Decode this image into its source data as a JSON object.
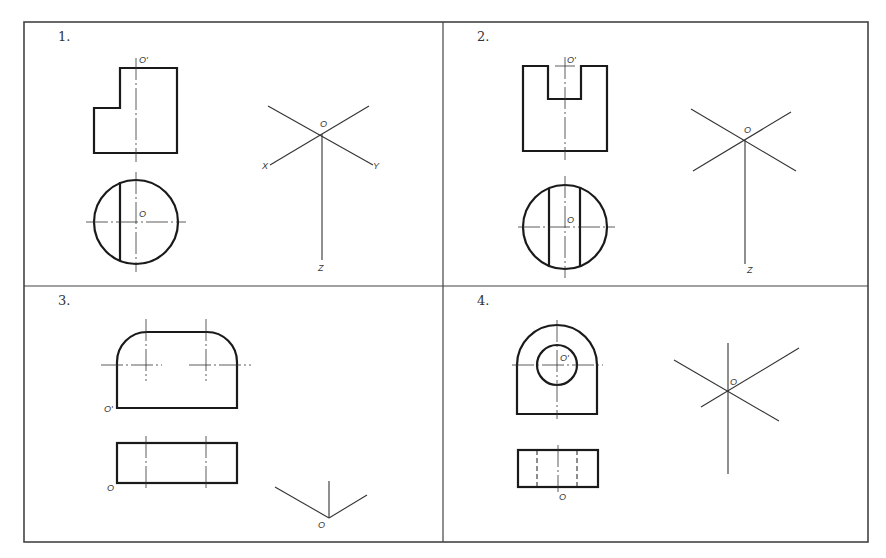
{
  "figure": {
    "type": "engineering-drawing-exercise"
  },
  "panels": [
    {
      "number": "1.",
      "front_view_label": "O'",
      "top_view_label": "O",
      "axes_labels": {
        "origin": "O",
        "x": "X",
        "y": "Y",
        "z": "Z"
      }
    },
    {
      "number": "2.",
      "front_view_label": "O'",
      "top_view_label": "O",
      "axes_labels": {
        "origin": "O",
        "z": "Z"
      }
    },
    {
      "number": "3.",
      "front_view_label": "O'",
      "top_view_label": "O",
      "axes_labels": {
        "origin": "O"
      }
    },
    {
      "number": "4.",
      "front_view_label": "O'",
      "top_view_label": "O",
      "axes_labels": {
        "origin": "O"
      }
    }
  ],
  "colors": {
    "line": "#1a1a1a",
    "thin": "#333333",
    "frame": "#444444"
  }
}
